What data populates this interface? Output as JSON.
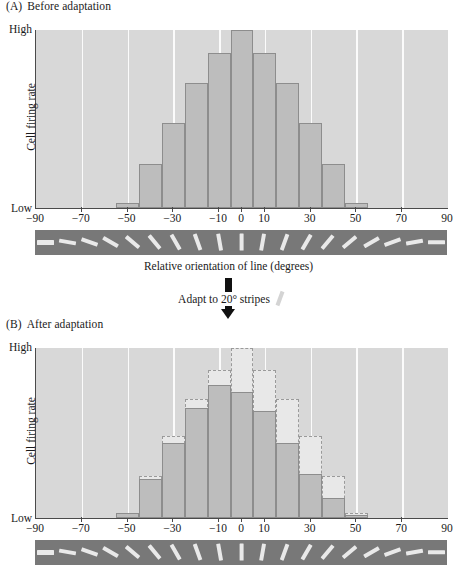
{
  "figure": {
    "panel_a_label": "(A)",
    "panel_a_title": "Before adaptation",
    "panel_b_label": "(B)",
    "panel_b_title": "After adaptation",
    "adapt_text": "Adapt to 20° stripes",
    "adapt_stripe_icon": "tilted-stripe-icon",
    "arrow_icon": "down-arrow-icon",
    "x_axis_title": "Relative orientation of line (degrees)",
    "y_axis_title": "Cell firing rate",
    "y_high_label": "High",
    "y_low_label": "Low"
  },
  "colors": {
    "plot_background": "#d8d8d8",
    "gridline": "#fbfbfb",
    "bar_fill": "#bdbdbd",
    "bar_stroke": "#8d8d8d",
    "ghost_fill": "#e8e8e8",
    "ghost_stroke": "#9a9a9a",
    "strip_background": "#787878",
    "strip_line": "#e9e9e9",
    "axis": "#4a4a4a",
    "text": "#1a1a1a"
  },
  "chart_data": [
    {
      "type": "bar",
      "title": "(A) Before adaptation",
      "xlabel": "Relative orientation of line (degrees)",
      "ylabel": "Cell firing rate",
      "xlim": [
        -90,
        90
      ],
      "ylim": [
        0,
        100
      ],
      "ytick_labels": [
        "Low",
        "High"
      ],
      "xtick_labels": [
        "-90",
        "-70",
        "-50",
        "-30",
        "-10",
        "0",
        "10",
        "30",
        "50",
        "70",
        "90"
      ],
      "xtick_values": [
        -90,
        -70,
        -50,
        -30,
        -10,
        0,
        10,
        30,
        50,
        70,
        90
      ],
      "grid": "vertical",
      "legend": "none",
      "bar_width_degrees": 10,
      "categories": [
        -50,
        -40,
        -30,
        -20,
        -10,
        0,
        10,
        20,
        30,
        40,
        50
      ],
      "values": [
        3,
        25,
        48,
        70,
        87,
        100,
        87,
        70,
        48,
        25,
        3
      ],
      "series": [
        {
          "name": "Before adaptation",
          "values": [
            3,
            25,
            48,
            70,
            87,
            100,
            87,
            70,
            48,
            25,
            3
          ]
        }
      ]
    },
    {
      "type": "bar",
      "title": "(B) After adaptation",
      "xlabel": "Relative orientation of line (degrees)",
      "ylabel": "Cell firing rate",
      "xlim": [
        -90,
        90
      ],
      "ylim": [
        0,
        100
      ],
      "ytick_labels": [
        "Low",
        "High"
      ],
      "xtick_labels": [
        "-90",
        "-70",
        "-50",
        "-30",
        "-10",
        "0",
        "10",
        "30",
        "50",
        "70",
        "90"
      ],
      "xtick_values": [
        -90,
        -70,
        -50,
        -30,
        -10,
        0,
        10,
        30,
        50,
        70,
        90
      ],
      "grid": "vertical",
      "legend": "none",
      "bar_width_degrees": 10,
      "categories": [
        -50,
        -40,
        -30,
        -20,
        -10,
        0,
        10,
        20,
        30,
        40,
        50
      ],
      "values": [
        3,
        23,
        44,
        65,
        78,
        74,
        63,
        44,
        26,
        12,
        2
      ],
      "series": [
        {
          "name": "After adaptation (solid bars)",
          "values": [
            3,
            23,
            44,
            65,
            78,
            74,
            63,
            44,
            26,
            12,
            2
          ]
        },
        {
          "name": "Before adaptation (dashed outline)",
          "values": [
            3,
            25,
            48,
            70,
            87,
            100,
            87,
            70,
            48,
            25,
            3
          ]
        }
      ]
    }
  ],
  "orientation_strip": {
    "name": "orientation-strip",
    "count": 19,
    "angles_deg": [
      -90,
      -80,
      -70,
      -60,
      -50,
      -40,
      -30,
      -20,
      -10,
      0,
      10,
      20,
      30,
      40,
      50,
      60,
      70,
      80,
      90
    ]
  }
}
